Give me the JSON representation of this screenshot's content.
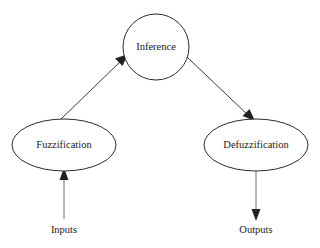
{
  "diagram": {
    "background_color": "#ffffff",
    "stroke_color": "#2b2b2b",
    "text_color": "#222222",
    "nodes": [
      {
        "id": "inference",
        "label": "Inference",
        "shape": "circle",
        "cx": 156,
        "cy": 47,
        "rx": 33,
        "ry": 33
      },
      {
        "id": "fuzzification",
        "label": "Fuzzification",
        "shape": "ellipse",
        "cx": 64,
        "cy": 145,
        "rx": 52,
        "ry": 26
      },
      {
        "id": "defuzzification",
        "label": "Defuzzification",
        "shape": "ellipse",
        "cx": 256,
        "cy": 145,
        "rx": 52,
        "ry": 26
      }
    ],
    "io_labels": [
      {
        "id": "inputs",
        "label": "Inputs",
        "x": 64,
        "y": 231
      },
      {
        "id": "outputs",
        "label": "Outputs",
        "x": 256,
        "y": 231
      }
    ],
    "edges": [
      {
        "id": "inputs-to-fuzzification",
        "from": "inputs",
        "to": "fuzzification",
        "direction": "up",
        "x1": 64,
        "y1": 219,
        "x2": 64,
        "y2": 172
      },
      {
        "id": "fuzzification-to-inference",
        "from": "fuzzification",
        "to": "inference",
        "direction": "up-right",
        "x1": 61,
        "y1": 119,
        "x2": 127,
        "y2": 55
      },
      {
        "id": "inference-to-defuzzification",
        "from": "inference",
        "to": "defuzzification",
        "direction": "down-right",
        "x1": 187,
        "y1": 57,
        "x2": 253,
        "y2": 120
      },
      {
        "id": "defuzzification-to-outputs",
        "from": "defuzzification",
        "to": "outputs",
        "direction": "down",
        "x1": 256,
        "y1": 171,
        "x2": 256,
        "y2": 218
      }
    ]
  }
}
